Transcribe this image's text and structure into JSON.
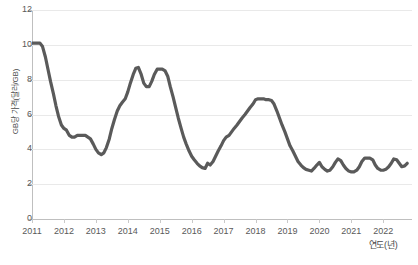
{
  "chart_data": {
    "type": "line",
    "title": "",
    "xlabel": "연도(년)",
    "ylabel": "GB당 가격(달러/GB)",
    "xlim": [
      2011,
      2022.9
    ],
    "ylim": [
      0,
      12
    ],
    "yticks": [
      0,
      2,
      4,
      6,
      8,
      10,
      12
    ],
    "ytick_labels": [
      "0",
      "2",
      "4",
      "6",
      "8",
      "10",
      "12"
    ],
    "xticks": [
      2011,
      2012,
      2013,
      2014,
      2015,
      2016,
      2017,
      2018,
      2019,
      2020,
      2021,
      2022
    ],
    "xtick_labels": [
      "2011",
      "2012",
      "2013",
      "2014",
      "2015",
      "2016",
      "2017",
      "2018",
      "2019",
      "2020",
      "2021",
      "2022"
    ],
    "grid": true,
    "legend": false,
    "line_color": "#5a5a5a",
    "line_width": 3.2,
    "series": [
      {
        "name": "GB당 가격",
        "x": [
          2011.0,
          2011.08,
          2011.17,
          2011.25,
          2011.33,
          2011.42,
          2011.5,
          2011.58,
          2011.67,
          2011.75,
          2011.83,
          2011.92,
          2012.0,
          2012.08,
          2012.17,
          2012.25,
          2012.33,
          2012.42,
          2012.5,
          2012.58,
          2012.67,
          2012.75,
          2012.83,
          2012.92,
          2013.0,
          2013.08,
          2013.17,
          2013.25,
          2013.33,
          2013.42,
          2013.5,
          2013.58,
          2013.67,
          2013.75,
          2013.83,
          2013.92,
          2014.0,
          2014.08,
          2014.17,
          2014.25,
          2014.33,
          2014.42,
          2014.5,
          2014.58,
          2014.67,
          2014.75,
          2014.83,
          2014.92,
          2015.0,
          2015.08,
          2015.17,
          2015.25,
          2015.33,
          2015.42,
          2015.5,
          2015.58,
          2015.67,
          2015.75,
          2015.83,
          2015.92,
          2016.0,
          2016.08,
          2016.17,
          2016.25,
          2016.33,
          2016.42,
          2016.5,
          2016.58,
          2016.67,
          2016.75,
          2016.83,
          2016.92,
          2017.0,
          2017.08,
          2017.17,
          2017.25,
          2017.33,
          2017.42,
          2017.5,
          2017.58,
          2017.67,
          2017.75,
          2017.83,
          2017.92,
          2018.0,
          2018.08,
          2018.17,
          2018.25,
          2018.33,
          2018.42,
          2018.5,
          2018.58,
          2018.67,
          2018.75,
          2018.83,
          2018.92,
          2019.0,
          2019.08,
          2019.17,
          2019.25,
          2019.33,
          2019.42,
          2019.5,
          2019.58,
          2019.67,
          2019.75,
          2019.83,
          2019.92,
          2020.0,
          2020.08,
          2020.17,
          2020.25,
          2020.33,
          2020.42,
          2020.5,
          2020.58,
          2020.67,
          2020.75,
          2020.83,
          2020.92,
          2021.0,
          2021.08,
          2021.17,
          2021.25,
          2021.33,
          2021.42,
          2021.5,
          2021.58,
          2021.67,
          2021.75,
          2021.83,
          2021.92,
          2022.0,
          2022.08,
          2022.17,
          2022.25,
          2022.33,
          2022.42,
          2022.5,
          2022.58,
          2022.67,
          2022.75
        ],
        "values": [
          10.1,
          10.1,
          10.1,
          10.1,
          9.9,
          9.3,
          8.6,
          7.9,
          7.2,
          6.5,
          5.9,
          5.4,
          5.2,
          5.1,
          4.8,
          4.7,
          4.7,
          4.8,
          4.8,
          4.8,
          4.8,
          4.7,
          4.6,
          4.3,
          4.0,
          3.8,
          3.7,
          3.8,
          4.1,
          4.6,
          5.2,
          5.7,
          6.2,
          6.5,
          6.7,
          6.9,
          7.3,
          7.8,
          8.3,
          8.65,
          8.7,
          8.3,
          7.8,
          7.6,
          7.6,
          7.9,
          8.3,
          8.6,
          8.6,
          8.6,
          8.5,
          8.2,
          7.6,
          7.0,
          6.4,
          5.8,
          5.2,
          4.7,
          4.3,
          3.9,
          3.6,
          3.4,
          3.2,
          3.05,
          2.95,
          2.9,
          3.2,
          3.1,
          3.3,
          3.6,
          3.9,
          4.2,
          4.5,
          4.7,
          4.8,
          5.0,
          5.2,
          5.4,
          5.6,
          5.8,
          6.0,
          6.2,
          6.4,
          6.6,
          6.85,
          6.9,
          6.9,
          6.9,
          6.85,
          6.85,
          6.8,
          6.6,
          6.2,
          5.8,
          5.4,
          5.0,
          4.6,
          4.2,
          3.9,
          3.6,
          3.3,
          3.1,
          2.95,
          2.85,
          2.8,
          2.75,
          2.9,
          3.1,
          3.25,
          3.0,
          2.85,
          2.75,
          2.8,
          3.0,
          3.25,
          3.45,
          3.35,
          3.1,
          2.9,
          2.75,
          2.7,
          2.7,
          2.8,
          3.0,
          3.3,
          3.5,
          3.5,
          3.5,
          3.4,
          3.1,
          2.9,
          2.8,
          2.8,
          2.85,
          3.0,
          3.2,
          3.45,
          3.4,
          3.2,
          3.0,
          3.05,
          3.2
        ]
      }
    ]
  },
  "caption": ""
}
